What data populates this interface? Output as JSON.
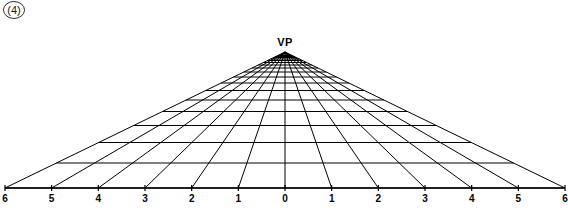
{
  "figure": {
    "number_label": "(4)",
    "vanishing_point_label": "VP",
    "line_color": "#000000",
    "background_color": "#ffffff",
    "text_color": "#000000"
  },
  "axis": {
    "tick_labels": [
      "6",
      "5",
      "4",
      "3",
      "2",
      "1",
      "0",
      "1",
      "2",
      "3",
      "4",
      "5",
      "6"
    ]
  },
  "chart_data": {
    "type": "diagram",
    "vanishing_point": {
      "x": 285,
      "y": 52,
      "label": "VP"
    },
    "baseline_y": 188,
    "baseline_x_start": 5,
    "baseline_x_end": 565,
    "tick_spacing": 46.67,
    "tick_values": [
      -6,
      -5,
      -4,
      -3,
      -2,
      -1,
      0,
      1,
      2,
      3,
      4,
      5,
      6
    ],
    "tick_labels": [
      "6",
      "5",
      "4",
      "3",
      "2",
      "1",
      "0",
      "1",
      "2",
      "3",
      "4",
      "5",
      "6"
    ],
    "radial_line_count": 13,
    "transversal_count": 18,
    "transversal_y": [
      188,
      163,
      142.5,
      125.5,
      111.5,
      100,
      90.5,
      83,
      77,
      72,
      68,
      65,
      62.5,
      60.5,
      59,
      57.5,
      56.5,
      55.5
    ],
    "xlabel": "",
    "ylabel": "",
    "grid": true,
    "legend": "none"
  }
}
